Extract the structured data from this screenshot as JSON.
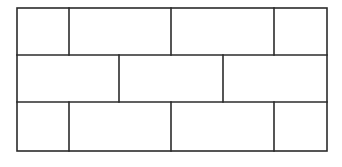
{
  "diagram": {
    "type": "brick-pattern-grid",
    "stroke_color": "#2b2b2b",
    "background": "#ffffff",
    "stroke_width": 1.6,
    "outer": {
      "x1": 17,
      "y1": 8,
      "x2": 327,
      "y2": 151
    },
    "row_dividers_y": [
      55,
      102
    ],
    "rows": [
      {
        "y1": 8,
        "y2": 55,
        "dividers_x": [
          69,
          171,
          274
        ]
      },
      {
        "y1": 55,
        "y2": 102,
        "dividers_x": [
          119,
          223
        ]
      },
      {
        "y1": 102,
        "y2": 151,
        "dividers_x": [
          69,
          171,
          274
        ]
      }
    ]
  }
}
